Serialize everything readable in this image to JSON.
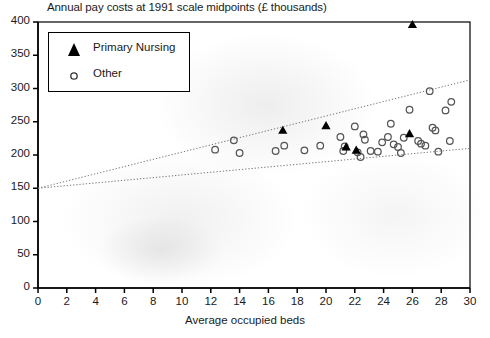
{
  "chart_data": {
    "type": "scatter",
    "title": "Annual pay costs at 1991 scale midpoints (£ thousands)",
    "xlabel": "Average occupied beds",
    "ylabel": "",
    "xlim": [
      0,
      30
    ],
    "ylim": [
      0,
      400
    ],
    "xticks": [
      0,
      2,
      4,
      6,
      8,
      10,
      12,
      14,
      16,
      18,
      20,
      22,
      24,
      26,
      28,
      30
    ],
    "yticks": [
      0,
      50,
      100,
      150,
      200,
      250,
      300,
      350,
      400
    ],
    "grid": false,
    "legend_position": "upper-left",
    "series": [
      {
        "name": "Primary Nursing",
        "marker": "filled-triangle",
        "color": "#000000",
        "points": [
          [
            17.0,
            238
          ],
          [
            20.0,
            245
          ],
          [
            21.4,
            213
          ],
          [
            22.1,
            208
          ],
          [
            25.8,
            233
          ],
          [
            26.0,
            397
          ]
        ]
      },
      {
        "name": "Other",
        "marker": "open-circle",
        "color": "#555555",
        "points": [
          [
            12.3,
            208
          ],
          [
            13.6,
            222
          ],
          [
            14.0,
            203
          ],
          [
            16.5,
            206
          ],
          [
            17.1,
            214
          ],
          [
            18.5,
            207
          ],
          [
            19.6,
            214
          ],
          [
            21.0,
            227
          ],
          [
            21.2,
            206
          ],
          [
            21.3,
            213
          ],
          [
            22.0,
            243
          ],
          [
            22.2,
            204
          ],
          [
            22.4,
            197
          ],
          [
            22.6,
            231
          ],
          [
            22.7,
            223
          ],
          [
            23.1,
            206
          ],
          [
            23.6,
            205
          ],
          [
            23.9,
            219
          ],
          [
            24.3,
            227
          ],
          [
            24.5,
            247
          ],
          [
            24.7,
            216
          ],
          [
            25.0,
            212
          ],
          [
            25.2,
            203
          ],
          [
            25.4,
            226
          ],
          [
            25.8,
            268
          ],
          [
            26.4,
            221
          ],
          [
            26.6,
            217
          ],
          [
            26.9,
            214
          ],
          [
            27.2,
            296
          ],
          [
            27.4,
            241
          ],
          [
            27.6,
            237
          ],
          [
            27.8,
            205
          ],
          [
            28.3,
            267
          ],
          [
            28.6,
            221
          ],
          [
            28.7,
            280
          ]
        ]
      }
    ],
    "trend_lines": [
      {
        "name": "upper-confidence-band",
        "style": "dotted",
        "from": [
          0,
          150
        ],
        "to": [
          30,
          313
        ]
      },
      {
        "name": "lower-confidence-band",
        "style": "dotted",
        "from": [
          0,
          150
        ],
        "to": [
          30,
          210
        ]
      }
    ]
  },
  "legend": {
    "items": [
      {
        "label": "Primary Nursing",
        "marker": "filled-triangle"
      },
      {
        "label": "Other",
        "marker": "open-circle"
      }
    ]
  },
  "colors": {
    "axis": "#000000",
    "marker_primary": "#000000",
    "marker_other": "#555555",
    "trend": "#777777",
    "background": "#ffffff"
  }
}
